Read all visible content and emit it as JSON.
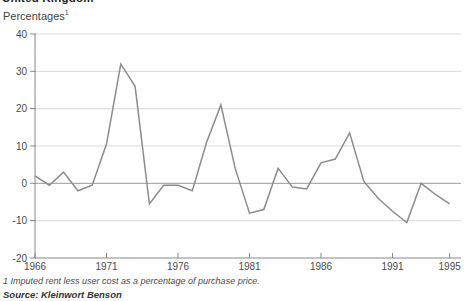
{
  "title": "United Kingdom",
  "y_axis_unit": "Percentages",
  "y_axis_unit_sup": "1",
  "footnote": "1 Imputed rent less user cost as a percentage of purchase price.",
  "source": "Source: Kleinwort Benson",
  "colors": {
    "line": "#8c8c8c",
    "grid": "#d9d9d9",
    "zero_line": "#9a9a9a",
    "axis": "#888888",
    "tick_label": "#4a4a4a"
  },
  "chart_data": {
    "type": "line",
    "title": "United Kingdom",
    "ylabel": "Percentages",
    "ylim": [
      -20,
      40
    ],
    "yticks": [
      40,
      30,
      20,
      10,
      0,
      -10,
      -20
    ],
    "xticks": [
      1966,
      1971,
      1976,
      1981,
      1986,
      1991,
      1995
    ],
    "grid": true,
    "legend": "none",
    "x": [
      1966,
      1967,
      1968,
      1969,
      1970,
      1971,
      1972,
      1973,
      1974,
      1975,
      1976,
      1977,
      1978,
      1979,
      1980,
      1981,
      1982,
      1983,
      1984,
      1985,
      1986,
      1987,
      1988,
      1989,
      1990,
      1991,
      1992,
      1993,
      1994,
      1995
    ],
    "series": [
      {
        "name": "Imputed rent less user cost as a percentage of purchase price",
        "values": [
          2,
          -0.5,
          3,
          -2,
          -0.5,
          10.5,
          32,
          26,
          -5.5,
          -0.5,
          -0.5,
          -2,
          11,
          21,
          4,
          -8,
          -7,
          4,
          -1,
          -1.5,
          5.5,
          6.5,
          13.5,
          0.5,
          -4,
          -7.5,
          -10.5,
          0,
          -3,
          -5.5
        ]
      }
    ]
  }
}
